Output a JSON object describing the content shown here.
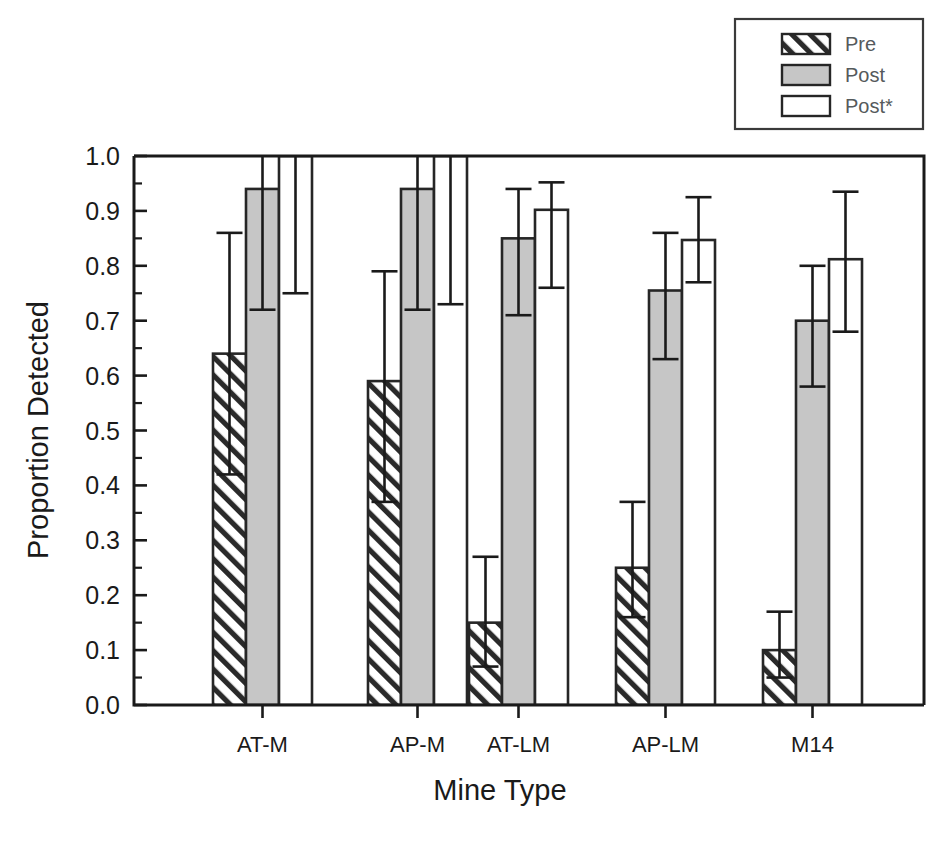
{
  "chart_data": {
    "type": "bar",
    "title": "",
    "subtitle": "",
    "xlabel": "Mine Type",
    "ylabel": "Proportion Detected",
    "categories": [
      "AT-M",
      "AP-M",
      "AT-LM",
      "AP-LM",
      "M14"
    ],
    "ylim": [
      0.0,
      1.0
    ],
    "ytick_labels": [
      "0.0",
      "0.1",
      "0.2",
      "0.3",
      "0.4",
      "0.5",
      "0.6",
      "0.7",
      "0.8",
      "0.9",
      "1.0"
    ],
    "ytick_values": [
      0.0,
      0.1,
      0.2,
      0.3,
      0.4,
      0.5,
      0.6,
      0.7,
      0.8,
      0.9,
      1.0
    ],
    "minor_tick_interval": 0.05,
    "grid": false,
    "legend_position": "top-right",
    "series": [
      {
        "name": "Pre",
        "fill": "hatch",
        "values": [
          0.64,
          0.59,
          0.15,
          0.25,
          0.1
        ],
        "err_upper": [
          0.86,
          0.79,
          0.27,
          0.37,
          0.17
        ],
        "err_lower": [
          0.42,
          0.37,
          0.07,
          0.16,
          0.05
        ]
      },
      {
        "name": "Post",
        "fill": "gray",
        "values": [
          0.94,
          0.94,
          0.85,
          0.755,
          0.7
        ],
        "err_upper": [
          1.06,
          1.06,
          0.94,
          0.86,
          0.8
        ],
        "err_lower": [
          0.72,
          0.72,
          0.71,
          0.63,
          0.58
        ]
      },
      {
        "name": "Post*",
        "fill": "white",
        "values": [
          1.0,
          1.0,
          0.902,
          0.847,
          0.812
        ],
        "err_upper": [
          1.06,
          1.06,
          0.952,
          0.925,
          0.935
        ],
        "err_lower": [
          0.75,
          0.73,
          0.76,
          0.77,
          0.68
        ]
      }
    ],
    "colors": {
      "gray_fill": "#c6c6c6",
      "white_fill": "#ffffff",
      "outline": "#262626",
      "axis": "#1a1a1a",
      "legend_text": "#555a5c"
    }
  },
  "legend": {
    "entries": [
      {
        "label": "Pre",
        "swatch": "hatch-swatch"
      },
      {
        "label": "Post",
        "swatch": "gray-swatch"
      },
      {
        "label": "Post*",
        "swatch": "white-swatch"
      }
    ]
  }
}
